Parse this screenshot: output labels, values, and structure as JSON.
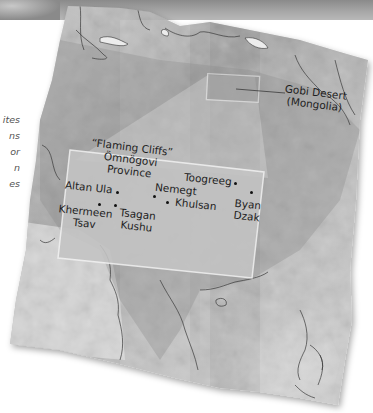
{
  "figure": {
    "side_caption_fragments": [
      "ites",
      "ns",
      "or",
      "n",
      "es"
    ]
  },
  "map": {
    "region": "East Asia",
    "inset_marker": {
      "label_line1": "Gobi Desert",
      "label_line2": "(Mongolia)"
    },
    "inset": {
      "title_line1": "“Flaming Cliffs”",
      "title_line2": "Ömnögovi",
      "title_line3": "Province",
      "sites": [
        {
          "name": "Altan Ula"
        },
        {
          "name_line1": "Khermeen",
          "name_line2": "Tsav"
        },
        {
          "name_line1": "Tsagan",
          "name_line2": "Kushu"
        },
        {
          "name": "Nemegt"
        },
        {
          "name": "Khulsan"
        },
        {
          "name": "Toogreeg"
        },
        {
          "name_line1": "Byan",
          "name_line2": "Dzak"
        }
      ]
    },
    "colors": {
      "terrain_light": "#d6d6d6",
      "terrain_mid": "#a9a9a9",
      "terrain_dark": "#7a7a7a",
      "inset_fill": "#c4c4c4",
      "label_text": "#1e1e1e",
      "border_line": "#3a3a3a"
    }
  }
}
